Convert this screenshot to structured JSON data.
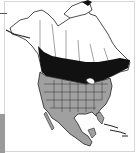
{
  "map": {
    "title": "",
    "region": "North America",
    "legend": [
      {
        "key": "breeding",
        "color": "#111111"
      },
      {
        "key": "year-round-or-winter",
        "color": "#a0a0a0"
      },
      {
        "key": "outside-range",
        "color": "#ffffff"
      }
    ],
    "colors": {
      "border": "#222222",
      "frame": "#d6d6d6",
      "side_bar": "#9a9a9a"
    }
  }
}
